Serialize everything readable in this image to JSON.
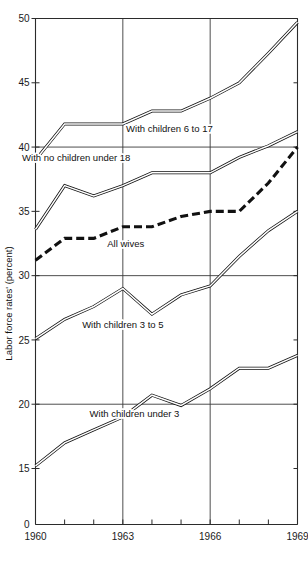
{
  "chart_data": {
    "type": "line",
    "title": "",
    "xlabel": "",
    "ylabel": "Labor force rates' (percent)",
    "xlim": [
      1960,
      1969
    ],
    "ylim": [
      0,
      50
    ],
    "y_axis_break": true,
    "y_break_between": [
      0,
      15
    ],
    "grid": true,
    "gridlines_y": [
      50,
      40,
      30,
      20
    ],
    "gridlines_x": [
      1963,
      1966
    ],
    "legend_position": "inline-annotations",
    "x": [
      1960,
      1961,
      1962,
      1963,
      1964,
      1965,
      1966,
      1967,
      1968,
      1969
    ],
    "yticks": [
      0,
      15,
      20,
      25,
      30,
      35,
      40,
      45,
      50
    ],
    "ytick_labels": [
      "0",
      "15",
      "20",
      "25",
      "30",
      "35",
      "40",
      "45",
      "50"
    ],
    "xticks": [
      1960,
      1961,
      1962,
      1963,
      1964,
      1965,
      1966,
      1967,
      1968,
      1969
    ],
    "xtick_labels": [
      "1960",
      "",
      "",
      "1963",
      "",
      "",
      "1966",
      "",
      "",
      "1969"
    ],
    "series": [
      {
        "name": "With children 6 to 17",
        "style": "double-line",
        "label_x": 1964.6,
        "label_y": 41.2,
        "values": [
          39.0,
          41.8,
          41.8,
          41.8,
          42.8,
          42.8,
          43.8,
          45.0,
          47.3,
          49.7
        ]
      },
      {
        "name": "With no children under 18",
        "style": "double-line",
        "label_x": 1961.4,
        "label_y": 38.9,
        "values": [
          33.6,
          37.0,
          36.2,
          37.0,
          38.0,
          38.0,
          38.0,
          39.2,
          40.1,
          41.2
        ]
      },
      {
        "name": "All wives",
        "style": "dashed-bold",
        "label_x": 1963.1,
        "label_y": 32.2,
        "values": [
          31.2,
          32.9,
          32.9,
          33.8,
          33.8,
          34.6,
          35.0,
          35.0,
          37.2,
          40.0
        ]
      },
      {
        "name": "With children 3 to 5",
        "style": "double-line",
        "label_x": 1963.0,
        "label_y": 25.9,
        "values": [
          25.1,
          26.6,
          27.6,
          29.0,
          27.0,
          28.5,
          29.2,
          31.5,
          33.5,
          35.0
        ]
      },
      {
        "name": "With children under 3",
        "style": "double-line",
        "label_x": 1963.4,
        "label_y": 19.0,
        "values": [
          15.2,
          17.0,
          18.0,
          19.0,
          20.7,
          19.9,
          21.2,
          22.8,
          22.8,
          23.8
        ]
      }
    ]
  },
  "colors": {
    "line": "#111111",
    "grid": "#3a3a3a",
    "axis": "#2b2b2b",
    "background": "#ffffff",
    "text": "#111111"
  }
}
